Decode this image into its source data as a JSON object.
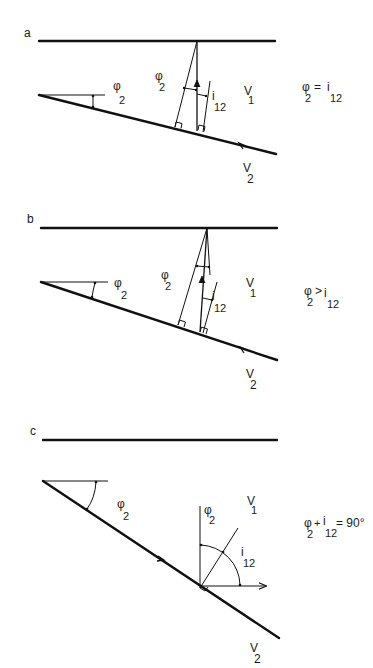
{
  "figure": {
    "panels": [
      {
        "id": "a",
        "label": "a",
        "layer_upper_velocity": {
          "main": "V",
          "sub": "1"
        },
        "layer_lower_velocity": {
          "main": "V",
          "sub": "2"
        },
        "dip_angle_label": {
          "main": "φ",
          "sub": "2"
        },
        "inner_angle_label": {
          "main": "φ",
          "sub": "2"
        },
        "incidence_label": {
          "main": "i",
          "sub": "12"
        },
        "relation": {
          "lhs_main": "φ",
          "lhs_sub": "2",
          "op": "=",
          "rhs_main": "i",
          "rhs_sub": "12",
          "extra": ""
        },
        "arrow_direction_on_interface": "up-dip"
      },
      {
        "id": "b",
        "label": "b",
        "layer_upper_velocity": {
          "main": "V",
          "sub": "1"
        },
        "layer_lower_velocity": {
          "main": "V",
          "sub": "2"
        },
        "dip_angle_label": {
          "main": "φ",
          "sub": "2"
        },
        "inner_angle_label": {
          "main": "φ",
          "sub": "2"
        },
        "incidence_label": {
          "main": "i",
          "sub": "12"
        },
        "relation": {
          "lhs_main": "φ",
          "lhs_sub": "2",
          "op": ">",
          "rhs_main": "i",
          "rhs_sub": "12",
          "extra": ""
        },
        "arrow_direction_on_interface": "up-dip"
      },
      {
        "id": "c",
        "label": "c",
        "layer_upper_velocity": {
          "main": "V",
          "sub": "1"
        },
        "layer_lower_velocity": {
          "main": "V",
          "sub": "2"
        },
        "dip_angle_label": {
          "main": "φ",
          "sub": "2"
        },
        "inner_angle_label": {
          "main": "φ",
          "sub": "2"
        },
        "incidence_label": {
          "main": "i",
          "sub": "12"
        },
        "relation": {
          "lhs_main": "φ",
          "lhs_sub": "2",
          "op": "+",
          "rhs_main": "i",
          "rhs_sub": "12",
          "extra": "= 90°"
        },
        "arrow_direction_on_interface": "down-dip"
      }
    ]
  }
}
